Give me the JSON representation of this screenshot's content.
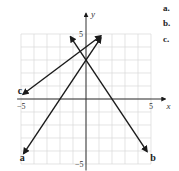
{
  "choices": [
    {
      "label": "a."
    },
    {
      "label": "b."
    },
    {
      "label": "c."
    }
  ],
  "chart_data": {
    "type": "line",
    "title": "",
    "xlabel": "x",
    "ylabel": "y",
    "xlim": [
      -5,
      5
    ],
    "ylim": [
      -5,
      5
    ],
    "grid": true,
    "tick_labels": {
      "x": [
        "-5",
        "5"
      ],
      "y": [
        "5",
        "-5"
      ]
    },
    "series": [
      {
        "name": "a",
        "slope": 1.5,
        "intercept": 3,
        "x_range": [
          -4.8,
          1.15
        ],
        "label_pos": [
          -5.1,
          -4.5
        ]
      },
      {
        "name": "b",
        "slope": -1.5,
        "intercept": 3,
        "x_range": [
          -1.2,
          4.7
        ],
        "label_pos": [
          4.95,
          -4.5
        ]
      },
      {
        "name": "c",
        "slope": 0.75,
        "intercept": 4,
        "x_range": [
          -4.85,
          1.15
        ],
        "label_pos": [
          -5.25,
          0.6
        ]
      }
    ]
  },
  "colors": {
    "line": "#1a1a1a",
    "grid": "#d8d8d8",
    "axis": "#333333"
  }
}
